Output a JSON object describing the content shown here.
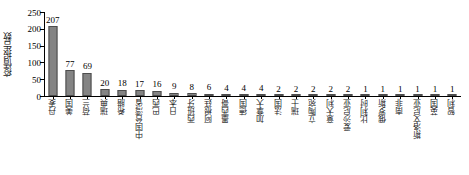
{
  "chart_data": {
    "type": "bar",
    "title": "",
    "subtitle": "",
    "xlabel": "",
    "ylabel": "疫情报告数",
    "ylim": [
      0,
      250
    ],
    "yticks": [
      0,
      50,
      100,
      150,
      200,
      250
    ],
    "grid": false,
    "legend": false,
    "orientation": "vertical",
    "bar_color": "#848484",
    "bar_edge_color": "#4d4d4d",
    "axis_color": "#000000",
    "categories": [
      "丹麦",
      "美国",
      "荷兰",
      "瑞典",
      "希腊",
      "中国台湾省",
      "巴西",
      "日本",
      "西班牙",
      "阿根廷",
      "墨西哥",
      "德国",
      "加拿大",
      "法国",
      "瑞士",
      "立陶宛",
      "意大利",
      "爱沙尼亚",
      "比利时",
      "俄罗斯",
      "南非",
      "斯洛文尼亚",
      "英国",
      "智利"
    ],
    "values": [
      207,
      77,
      69,
      20,
      18,
      17,
      16,
      9,
      8,
      6,
      4,
      4,
      4,
      2,
      2,
      2,
      2,
      2,
      1,
      1,
      1,
      1,
      1,
      1
    ],
    "value_labels": [
      "207",
      "77",
      "69",
      "20",
      "18",
      "17",
      "16",
      "9",
      "8",
      "6",
      "4",
      "4",
      "4",
      "2",
      "2",
      "2",
      "2",
      "2",
      "1",
      "1",
      "1",
      "1",
      "1",
      "1"
    ],
    "ytick_labels": [
      "0",
      "50",
      "100",
      "150",
      "200",
      "250"
    ]
  }
}
